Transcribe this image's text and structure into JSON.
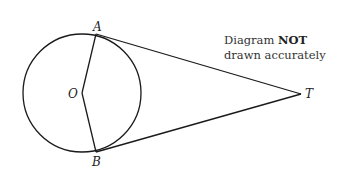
{
  "diagram": {
    "type": "geometry",
    "points": {
      "A": {
        "label": "A",
        "x": 96,
        "y": 34
      },
      "B": {
        "label": "B",
        "x": 96,
        "y": 152
      },
      "O": {
        "label": "O",
        "x": 82,
        "y": 93
      },
      "T": {
        "label": "T",
        "x": 301,
        "y": 94
      }
    },
    "circle": {
      "center": "O",
      "cx": 82,
      "cy": 93,
      "r": 59
    },
    "segments": [
      {
        "from": "O",
        "to": "A"
      },
      {
        "from": "O",
        "to": "B"
      },
      {
        "from": "A",
        "to": "T"
      },
      {
        "from": "B",
        "to": "T"
      }
    ],
    "note": {
      "line1_prefix": "Diagram ",
      "line1_bold": "NOT",
      "line2": "drawn accurately"
    },
    "stroke_color": "#1a1a1a"
  }
}
